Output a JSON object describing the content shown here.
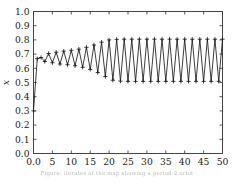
{
  "figure": {
    "caption": "Figure: iterates of the map showing a period-2 orbit"
  },
  "chart_data": {
    "type": "line",
    "title": "",
    "subtitle": "",
    "xlabel": "n",
    "ylabel": "x",
    "xlim": [
      0,
      50
    ],
    "ylim": [
      0.0,
      1.0
    ],
    "grid": false,
    "legend": null,
    "legend_position": "none",
    "marker": "plus",
    "line_color": "#1a1a1a",
    "frame_color": "#444444",
    "xticks": [
      0,
      5,
      10,
      15,
      20,
      25,
      30,
      35,
      40,
      45,
      50
    ],
    "xtick_labels": [
      "0.0",
      "5",
      "10",
      "15",
      "20",
      "25",
      "30",
      "35",
      "40",
      "45",
      "50"
    ],
    "yticks": [
      0.0,
      0.1,
      0.2,
      0.3,
      0.4,
      0.5,
      0.6,
      0.7,
      0.8,
      0.9,
      1.0
    ],
    "ytick_labels": [
      "0.0",
      "0.1",
      "0.2",
      "0.3",
      "0.4",
      "0.5",
      "0.6",
      "0.7",
      "0.8",
      "0.9",
      "1.0"
    ],
    "x": [
      0,
      1,
      2,
      3,
      4,
      5,
      6,
      7,
      8,
      9,
      10,
      11,
      12,
      13,
      14,
      15,
      16,
      17,
      18,
      19,
      20,
      21,
      22,
      23,
      24,
      25,
      26,
      27,
      28,
      29,
      30,
      31,
      32,
      33,
      34,
      35,
      36,
      37,
      38,
      39,
      40,
      41,
      42,
      43,
      44,
      45,
      46,
      47,
      48,
      49,
      50
    ],
    "series": [
      {
        "name": "x_n",
        "values": [
          0.3,
          0.668,
          0.676,
          0.648,
          0.704,
          0.639,
          0.713,
          0.63,
          0.721,
          0.625,
          0.727,
          0.618,
          0.735,
          0.607,
          0.748,
          0.592,
          0.764,
          0.57,
          0.784,
          0.542,
          0.8,
          0.516,
          0.804,
          0.51,
          0.805,
          0.508,
          0.805,
          0.508,
          0.805,
          0.508,
          0.805,
          0.508,
          0.805,
          0.508,
          0.805,
          0.508,
          0.805,
          0.508,
          0.805,
          0.508,
          0.805,
          0.508,
          0.805,
          0.508,
          0.805,
          0.508,
          0.805,
          0.508,
          0.805,
          0.508,
          0.805
        ]
      }
    ]
  }
}
